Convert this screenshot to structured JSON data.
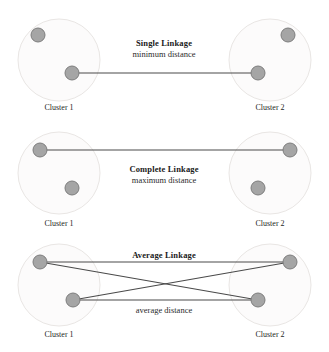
{
  "figure": {
    "width": 329,
    "height": 352,
    "background": "#ffffff",
    "topic": "Hierarchical clustering linkage criteria"
  },
  "style": {
    "point_fill": "#a5a5a5",
    "point_stroke": "#7d7d7d",
    "ring_fill": "#fcfbfb",
    "ring_stroke": "#e9e6e4",
    "line_color": "#4a4a4a",
    "title_color": "#1a1a1a",
    "label_color": "#262626"
  },
  "panels": [
    {
      "id": "single-linkage",
      "title": "Single Linkage",
      "subtitle": "minimum distance",
      "title_x": 164,
      "title_y": 46,
      "subtitle_x": 164,
      "subtitle_y": 57,
      "clusters": [
        {
          "id": "cluster-1",
          "label": "Cluster 1",
          "label_x": 59,
          "label_y": 110,
          "ring": {
            "cx": 59,
            "cy": 60,
            "r": 41
          },
          "points": [
            {
              "id": "c1-p1",
              "cx": 38,
              "cy": 35,
              "r": 7
            },
            {
              "id": "c1-p2",
              "cx": 72,
              "cy": 73,
              "r": 7
            }
          ]
        },
        {
          "id": "cluster-2",
          "label": "Cluster 2",
          "label_x": 270,
          "label_y": 110,
          "ring": {
            "cx": 270,
            "cy": 60,
            "r": 41
          },
          "points": [
            {
              "id": "c2-p1",
              "cx": 288,
              "cy": 35,
              "r": 7
            },
            {
              "id": "c2-p2",
              "cx": 258,
              "cy": 73,
              "r": 7
            }
          ]
        }
      ],
      "links": [
        {
          "id": "min-distance-link",
          "x1": 72,
          "y1": 73,
          "x2": 258,
          "y2": 73
        }
      ],
      "annotation": null
    },
    {
      "id": "complete-linkage",
      "title": "Complete Linkage",
      "subtitle": "maximum distance",
      "title_x": 164,
      "title_y": 172,
      "subtitle_x": 164,
      "subtitle_y": 183,
      "clusters": [
        {
          "id": "cluster-1",
          "label": "Cluster 1",
          "label_x": 59,
          "label_y": 226,
          "ring": {
            "cx": 59,
            "cy": 173,
            "r": 41
          },
          "points": [
            {
              "id": "c1-p1",
              "cx": 40,
              "cy": 150,
              "r": 7
            },
            {
              "id": "c1-p2",
              "cx": 72,
              "cy": 188,
              "r": 7
            }
          ]
        },
        {
          "id": "cluster-2",
          "label": "Cluster 2",
          "label_x": 270,
          "label_y": 226,
          "ring": {
            "cx": 270,
            "cy": 173,
            "r": 41
          },
          "points": [
            {
              "id": "c2-p1",
              "cx": 290,
              "cy": 150,
              "r": 7
            },
            {
              "id": "c2-p2",
              "cx": 258,
              "cy": 188,
              "r": 7
            }
          ]
        }
      ],
      "links": [
        {
          "id": "max-distance-link",
          "x1": 40,
          "y1": 150,
          "x2": 290,
          "y2": 150
        }
      ],
      "annotation": null
    },
    {
      "id": "average-linkage",
      "title": "Average Linkage",
      "subtitle": "",
      "title_x": 164,
      "title_y": 258,
      "subtitle_x": 164,
      "subtitle_y": 258,
      "clusters": [
        {
          "id": "cluster-1",
          "label": "Cluster 1",
          "label_x": 59,
          "label_y": 337,
          "ring": {
            "cx": 59,
            "cy": 285,
            "r": 41
          },
          "points": [
            {
              "id": "c1-p1",
              "cx": 40,
              "cy": 262,
              "r": 7
            },
            {
              "id": "c1-p2",
              "cx": 73,
              "cy": 300,
              "r": 7
            }
          ]
        },
        {
          "id": "cluster-2",
          "label": "Cluster 2",
          "label_x": 270,
          "label_y": 337,
          "ring": {
            "cx": 270,
            "cy": 285,
            "r": 41
          },
          "points": [
            {
              "id": "c2-p1",
              "cx": 290,
              "cy": 262,
              "r": 7
            },
            {
              "id": "c2-p2",
              "cx": 258,
              "cy": 300,
              "r": 7
            }
          ]
        }
      ],
      "links": [
        {
          "id": "avg-link-1",
          "x1": 40,
          "y1": 262,
          "x2": 290,
          "y2": 262
        },
        {
          "id": "avg-link-2",
          "x1": 40,
          "y1": 262,
          "x2": 258,
          "y2": 300
        },
        {
          "id": "avg-link-3",
          "x1": 73,
          "y1": 300,
          "x2": 290,
          "y2": 262
        },
        {
          "id": "avg-link-4",
          "x1": 73,
          "y1": 300,
          "x2": 258,
          "y2": 300
        }
      ],
      "annotation": {
        "id": "average-distance-annotation",
        "text": "average distance",
        "x": 164,
        "y": 313
      }
    }
  ]
}
